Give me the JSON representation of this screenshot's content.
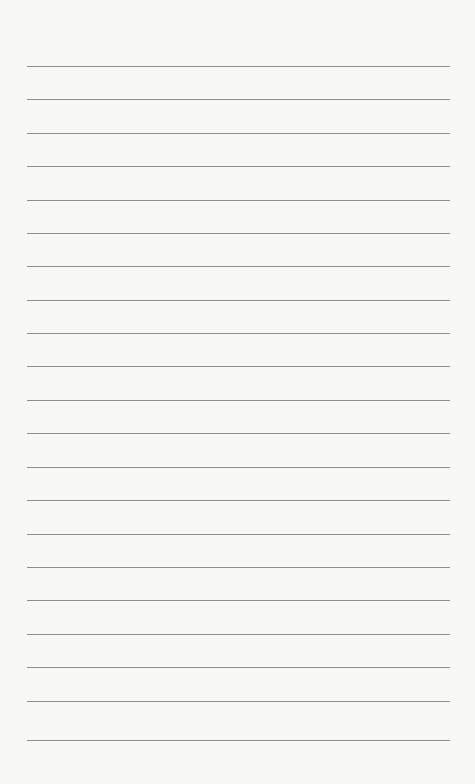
{
  "page": {
    "type": "lined-paper",
    "background_color": "#f7f7f6",
    "line_color": "#8e8e8e",
    "line_count": 21,
    "line_left": 27,
    "line_width": 423,
    "line_positions": [
      66,
      99,
      133,
      166,
      200,
      233,
      266,
      300,
      333,
      366,
      400,
      433,
      467,
      500,
      534,
      567,
      600,
      634,
      667,
      701,
      740
    ]
  }
}
